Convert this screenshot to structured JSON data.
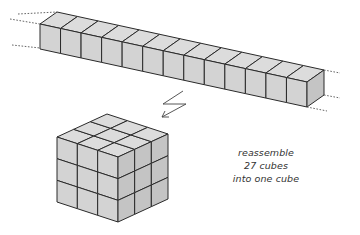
{
  "figure": {
    "bar": {
      "visible_cubes": 13,
      "continues_both_ends": true
    },
    "big_cube": {
      "grid": 3
    },
    "caption": {
      "lines": [
        "reassemble",
        "27 cubes",
        "into one cube"
      ]
    },
    "colors": {
      "face_front": "#d3d3d3",
      "face_top": "#dcdcdc",
      "face_side": "#c4c4c4",
      "stroke": "#2a2a2a"
    }
  }
}
